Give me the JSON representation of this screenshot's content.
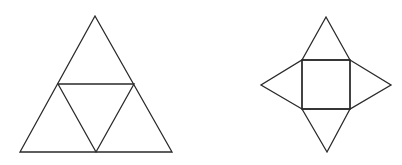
{
  "figures": [
    {
      "name": "tetrahedron-net",
      "description": "Large equilateral triangle subdivided into four smaller triangles",
      "outer": [
        [
          95,
          16
        ],
        [
          20,
          152
        ],
        [
          172,
          152
        ]
      ],
      "inner": [
        [
          58,
          84
        ],
        [
          134,
          84
        ],
        [
          96,
          152
        ]
      ]
    },
    {
      "name": "square-pyramid-net",
      "description": "Square with four triangles attached on each side",
      "square": [
        [
          302,
          60
        ],
        [
          350,
          60
        ],
        [
          350,
          109
        ],
        [
          302,
          109
        ]
      ],
      "apexes": {
        "top": [
          326,
          17
        ],
        "left": [
          261,
          85
        ],
        "right": [
          391,
          85
        ],
        "bottom": [
          327,
          152
        ]
      }
    }
  ],
  "colors": {
    "stroke": "#2a2a2a",
    "background": "#ffffff"
  }
}
